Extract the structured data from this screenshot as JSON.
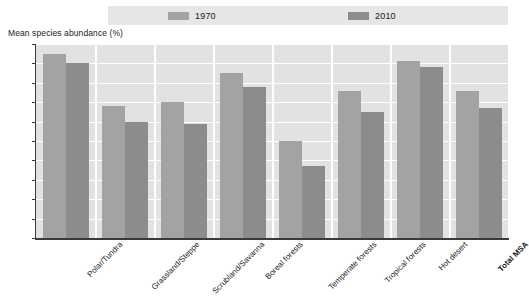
{
  "axis_title": "Mean species abundance (%)",
  "legend": {
    "entries": [
      {
        "label": "1970",
        "color": "#a3a3a3",
        "name": "legend-1970"
      },
      {
        "label": "2010",
        "color": "#8c8c8c",
        "name": "legend-2010"
      }
    ]
  },
  "y_axis": {
    "ticks": [
      "100",
      "90",
      "80",
      "70",
      "60",
      "50",
      "40",
      "30",
      "20",
      "10",
      "0"
    ]
  },
  "chart_data": {
    "type": "bar",
    "title": "",
    "subtitle": "",
    "xlabel": "",
    "ylabel": "Mean species abundance (%)",
    "ylim": [
      0,
      100
    ],
    "ytick_step": 10,
    "grid": true,
    "legend_position": "top",
    "categories": [
      "Polar/Tundra",
      "Grassland/Steppe",
      "Scrubland/Savanna",
      "Boreal forests",
      "Temperate forests",
      "Tropical forests",
      "Hot desert",
      "Total MSA"
    ],
    "categories_bold": [
      false,
      false,
      false,
      false,
      false,
      false,
      false,
      true
    ],
    "series": [
      {
        "name": "1970",
        "color": "#a3a3a3",
        "values": [
          95,
          68,
          70,
          85,
          50,
          76,
          91,
          76
        ]
      },
      {
        "name": "2010",
        "color": "#8c8c8c",
        "values": [
          90,
          60,
          59,
          78,
          37,
          65,
          88,
          67
        ]
      }
    ]
  }
}
